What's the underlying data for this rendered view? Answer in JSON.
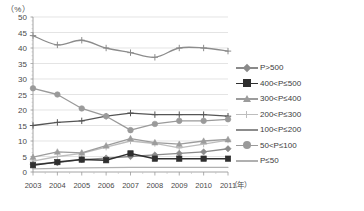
{
  "chart_data": {
    "type": "line",
    "title": "",
    "xlabel": "年",
    "ylabel": "%",
    "unit_label": "（%）",
    "x_axis_suffix": "（年）",
    "categories": [
      "2003",
      "2004",
      "2005",
      "2006",
      "2007",
      "2008",
      "2009",
      "2010",
      "2011"
    ],
    "ylim": [
      0,
      50
    ],
    "y_ticks": [
      0,
      5,
      10,
      15,
      20,
      25,
      30,
      35,
      40,
      45,
      50
    ],
    "grid": true,
    "legend_position": "right",
    "series": [
      {
        "name": "P>500",
        "marker": "diamond",
        "color": "#8a8a8a",
        "values": [
          2.5,
          3.0,
          4.0,
          4.5,
          5.0,
          5.5,
          6.0,
          6.5,
          7.5
        ]
      },
      {
        "name": "400<P≤500",
        "marker": "square",
        "color": "#2f2f2f",
        "values": [
          2.2,
          3.2,
          4.0,
          3.8,
          6.0,
          4.3,
          4.3,
          4.3,
          4.3
        ]
      },
      {
        "name": "300<P≤400",
        "marker": "triangle",
        "color": "#9c9c9c",
        "values": [
          4.8,
          6.5,
          6.2,
          8.5,
          10.8,
          9.5,
          9.0,
          10.0,
          10.5
        ]
      },
      {
        "name": "200<P≤300",
        "marker": "cross",
        "color": "#bdbdbd",
        "values": [
          3.5,
          5.0,
          6.0,
          8.0,
          10.0,
          9.2,
          7.8,
          9.0,
          10.3
        ]
      },
      {
        "name": "100<P≤200",
        "marker": "cross",
        "color": "#8c8c8c",
        "values": [
          44.0,
          41.0,
          42.5,
          40.0,
          38.5,
          37.0,
          40.0,
          40.0,
          39.0
        ]
      },
      {
        "name": "50<P≤100",
        "marker": "circle",
        "color": "#9a9a9a",
        "values": [
          27.0,
          25.0,
          20.5,
          18.0,
          13.5,
          15.5,
          16.5,
          16.5,
          17.0
        ]
      },
      {
        "name": "P≤50",
        "marker": "none",
        "color": "#b0b0b0",
        "values": [
          1.0,
          1.2,
          1.3,
          1.4,
          1.5,
          1.5,
          1.5,
          1.5,
          1.5
        ]
      },
      {
        "name": "200-300-rising",
        "marker": "cross",
        "color": "#555555",
        "values": [
          15.0,
          16.0,
          16.5,
          18.0,
          19.0,
          18.5,
          18.5,
          18.5,
          18.0
        ]
      }
    ]
  },
  "legend": {
    "items": [
      {
        "label": "P>500",
        "marker": "diamond",
        "color": "#8a8a8a"
      },
      {
        "label": "400<P≤500",
        "marker": "square",
        "color": "#2f2f2f"
      },
      {
        "label": "300<P≤400",
        "marker": "triangle",
        "color": "#9c9c9c"
      },
      {
        "label": "200<P≤300",
        "marker": "cross",
        "color": "#bdbdbd"
      },
      {
        "label": "100<P≤200",
        "marker": "none",
        "color": "#8c8c8c"
      },
      {
        "label": "50<P≤100",
        "marker": "circle",
        "color": "#9a9a9a"
      },
      {
        "label": "P≤50",
        "marker": "none",
        "color": "#b0b0b0"
      }
    ]
  }
}
